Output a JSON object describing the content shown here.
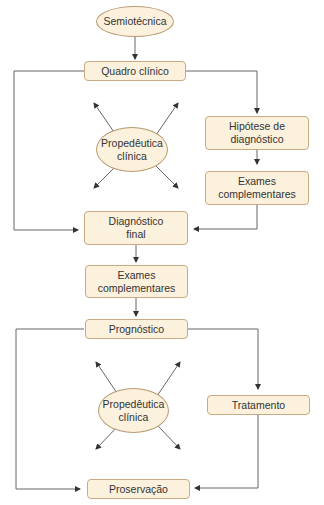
{
  "diagram": {
    "colors": {
      "fill": "#fbf1dd",
      "border": "#c9ab83",
      "line": "#555555",
      "text": "#333333"
    },
    "nodes": {
      "semiotecnica": "Semiotécnica",
      "quadro_clinico": "Quadro clínico",
      "propedeutica_1": "Propedêutica\nclínica",
      "hipotese": "Hipótese de\ndiagnóstico",
      "exames_1": "Exames\ncomplementares",
      "diagnostico_final": "Diagnóstico\nfinal",
      "exames_2": "Exames\ncomplementares",
      "prognostico": "Prognóstico",
      "propedeutica_2": "Propedêutica\nclínica",
      "tratamento": "Tratamento",
      "proservacao": "Proservação"
    }
  }
}
